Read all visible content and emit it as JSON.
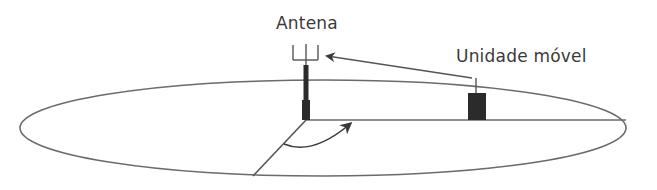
{
  "diagram": {
    "type": "cellular-antenna-geometry",
    "labels": {
      "antenna": "Antena",
      "mobile_unit": "Unidade móvel"
    },
    "colors": {
      "line": "#6b6b6b",
      "fill": "#2b2b2b",
      "text": "#3a3a3a",
      "background": "#ffffff"
    },
    "elements": [
      {
        "name": "ground-plane-ellipse",
        "shape": "ellipse",
        "cx": 323,
        "cy": 128,
        "rx": 303,
        "ry": 48
      },
      {
        "name": "antenna-mast",
        "shape": "tower",
        "x": 306,
        "base_y": 120,
        "top_y": 62
      },
      {
        "name": "antenna-fork",
        "shape": "trident",
        "prongs_x": [
          293,
          306,
          318
        ],
        "top_y": 45,
        "bottom_y": 60
      },
      {
        "name": "mobile-unit",
        "shape": "rect",
        "x": 468,
        "y": 93,
        "w": 18,
        "h": 27
      },
      {
        "name": "mobile-unit-antenna",
        "shape": "line",
        "x": 476,
        "y1": 78,
        "y2": 93
      },
      {
        "name": "signal-arrow",
        "shape": "arrow",
        "from": [
          472,
          78
        ],
        "to": [
          326,
          56
        ]
      },
      {
        "name": "azimuth-reference-line",
        "shape": "line",
        "from": [
          306,
          120
        ],
        "to": [
          626,
          120
        ]
      },
      {
        "name": "radial-line",
        "shape": "line",
        "from": [
          306,
          120
        ],
        "to": [
          253,
          176
        ]
      },
      {
        "name": "azimuth-angle-arrow",
        "shape": "curved-arrow",
        "from": [
          284,
          144
        ],
        "to": [
          351,
          123
        ]
      }
    ]
  }
}
